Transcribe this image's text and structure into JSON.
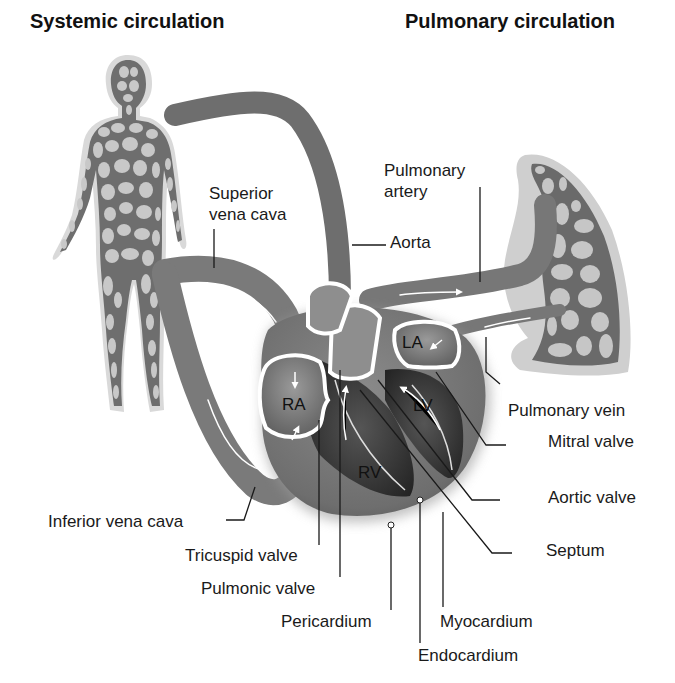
{
  "titles": {
    "systemic": "Systemic circulation",
    "pulmonary": "Pulmonary circulation"
  },
  "chambers": {
    "ra": "RA",
    "rv": "RV",
    "la": "LA",
    "lv": "LV"
  },
  "labels": {
    "superior_vena_cava_1": "Superior",
    "superior_vena_cava_2": "vena cava",
    "aorta": "Aorta",
    "pulmonary_artery_1": "Pulmonary",
    "pulmonary_artery_2": "artery",
    "pulmonary_vein": "Pulmonary vein",
    "mitral_valve": "Mitral valve",
    "aortic_valve": "Aortic valve",
    "septum": "Septum",
    "inferior_vena_cava": "Inferior vena cava",
    "tricuspid_valve": "Tricuspid valve",
    "pulmonic_valve": "Pulmonic valve",
    "pericardium": "Pericardium",
    "myocardium": "Myocardium",
    "endocardium": "Endocardium"
  },
  "colors": {
    "vessel": "#7a7a7a",
    "vessel_light": "#b8b8b8",
    "chamber_dark": "#3a3a3a",
    "halo": "#d6d6d6",
    "cell": "#c8c8c8",
    "text": "#1a1a1a"
  }
}
